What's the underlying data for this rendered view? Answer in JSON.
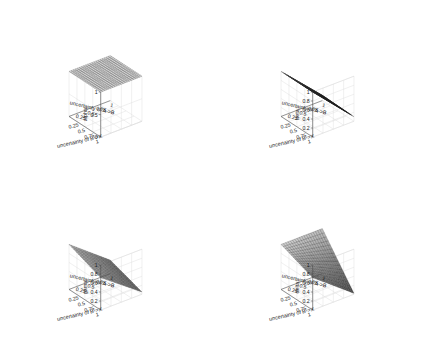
{
  "figure": {
    "background": "#ffffff",
    "layout": "2x2",
    "panel_order": [
      "alpha",
      "beta",
      "gama",
      "delta"
    ]
  },
  "chart_data": [
    {
      "type": "surface",
      "title": "",
      "zlabel": "alpha",
      "xlabel": "uncertainty of A->B",
      "ylabel": "uncertainty of B->X",
      "xticks": [
        "0.25",
        "0.5",
        "0.75",
        "1"
      ],
      "xtickvals": [
        0.25,
        0.5,
        0.75,
        1
      ],
      "yticks": [
        "0.25",
        "0.5",
        "0.75",
        "1"
      ],
      "ytickvals": [
        0.25,
        0.5,
        0.75,
        1
      ],
      "zticks": [
        "0",
        "0.5",
        "1"
      ],
      "ztickvals": [
        0,
        0.5,
        1
      ],
      "xlim": [
        0,
        1
      ],
      "ylim": [
        0,
        1
      ],
      "zlim": [
        0,
        1
      ],
      "grid": true,
      "colormap": "gray",
      "surface_formula": "constant",
      "surface_description": "flat dark plane held at alpha = 1 across the whole domain",
      "z_corners": {
        "x0y0": 1,
        "x1y0": 1,
        "x0y1": 1,
        "x1y1": 1
      },
      "shade_corners": {
        "x0y0": 0.12,
        "x1y0": 0.12,
        "x0y1": 0.12,
        "x1y1": 0.12
      },
      "nx": 20,
      "ny": 20
    },
    {
      "type": "surface",
      "title": "",
      "zlabel": "beta",
      "xlabel": "uncertainty of A->B",
      "ylabel": "uncertainty of B->X",
      "xticks": [
        "0.25",
        "0.5",
        "0.75",
        "1"
      ],
      "xtickvals": [
        0.25,
        0.5,
        0.75,
        1
      ],
      "yticks": [
        "0.25",
        "0.5",
        "0.75",
        "1"
      ],
      "ytickvals": [
        0.25,
        0.5,
        0.75,
        1
      ],
      "zticks": [
        "0.2",
        "0.4",
        "0.6",
        "0.8",
        "1"
      ],
      "ztickvals": [
        0.2,
        0.4,
        0.6,
        0.8,
        1
      ],
      "xlim": [
        0,
        1
      ],
      "ylim": [
        0,
        1
      ],
      "zlim": [
        0,
        1
      ],
      "grid": true,
      "colormap": "gray",
      "surface_formula": "plane",
      "surface_description": "plane sloping from beta = 1 at low uncertainty of A->B down to beta = 0.1 at high uncertainty of A->B",
      "z_corners": {
        "x0y0": 1,
        "x1y0": 0.12,
        "x0y1": 1,
        "x1y1": 0.1
      },
      "shade_corners": {
        "x0y0": 0.15,
        "x1y0": 0.82,
        "x0y1": 0.2,
        "x1y1": 0.88
      },
      "nx": 14,
      "ny": 20
    },
    {
      "type": "surface",
      "title": "",
      "zlabel": "gama",
      "xlabel": "uncertainty of A->B",
      "ylabel": "uncertainty of B->X",
      "xticks": [
        "0.25",
        "0.5",
        "0.75",
        "1"
      ],
      "xtickvals": [
        0.25,
        0.5,
        0.75,
        1
      ],
      "yticks": [
        "0.25",
        "0.5",
        "0.75",
        "1"
      ],
      "ytickvals": [
        0.25,
        0.5,
        0.75,
        1
      ],
      "zticks": [
        "0.2",
        "0.4",
        "0.6",
        "0.8",
        "1"
      ],
      "ztickvals": [
        0.2,
        0.4,
        0.6,
        0.8,
        1
      ],
      "xlim": [
        0,
        1
      ],
      "ylim": [
        0,
        1
      ],
      "zlim": [
        0,
        1
      ],
      "grid": true,
      "colormap": "gray",
      "surface_formula": "plane",
      "surface_description": "thin near edge-on sheet descending from gama = 1 at the back-left corner to about gama = 0.05 at the front-right corner",
      "z_corners": {
        "x0y0": 1,
        "x1y0": 0.3,
        "x0y1": 0.72,
        "x1y1": 0.05
      },
      "shade_corners": {
        "x0y0": 0.2,
        "x1y0": 0.55,
        "x0y1": 0.35,
        "x1y1": 0.6
      },
      "nx": 18,
      "ny": 14
    },
    {
      "type": "surface",
      "title": "",
      "zlabel": "delta",
      "xlabel": "uncertainty of A->B",
      "ylabel": "uncertainty of B->X",
      "xticks": [
        "0.25",
        "0.5",
        "0.75",
        "1"
      ],
      "xtickvals": [
        0.25,
        0.5,
        0.75,
        1
      ],
      "yticks": [
        "0.25",
        "0.5",
        "0.75",
        "1"
      ],
      "ytickvals": [
        0.25,
        0.5,
        0.75,
        1
      ],
      "zticks": [
        "0.2",
        "0.4",
        "0.6",
        "0.8",
        "1"
      ],
      "ztickvals": [
        0.2,
        0.4,
        0.6,
        0.8,
        1
      ],
      "xlim": [
        0,
        1
      ],
      "ylim": [
        0,
        1
      ],
      "zlim": [
        0,
        1
      ],
      "grid": true,
      "colormap": "gray",
      "surface_formula": "plane",
      "surface_description": "plane held at delta = 1 along the back edge and falling toward delta near 0 at the front-right corner",
      "z_corners": {
        "x0y0": 1,
        "x1y0": 1,
        "x0y1": 0.72,
        "x1y1": 0.02
      },
      "shade_corners": {
        "x0y0": 0.18,
        "x1y0": 0.25,
        "x0y1": 0.5,
        "x1y1": 0.72
      },
      "nx": 18,
      "ny": 16
    }
  ]
}
